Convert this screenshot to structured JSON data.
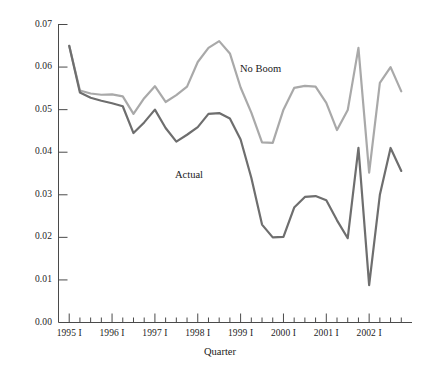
{
  "chart_data": {
    "type": "line",
    "title": "",
    "xlabel": "Quarter",
    "ylabel": "",
    "ylim": [
      0.0,
      0.07
    ],
    "xlim": [
      "1995 I",
      "2002 IV"
    ],
    "grid": false,
    "legend": "inline-annotations",
    "y_ticks": [
      "0.00",
      "0.01",
      "0.02",
      "0.03",
      "0.04",
      "0.05",
      "0.06",
      "0.07"
    ],
    "y_tick_values": [
      0.0,
      0.01,
      0.02,
      0.03,
      0.04,
      0.05,
      0.06,
      0.07
    ],
    "x_ticks": [
      "1995 I",
      "1996 I",
      "1997 I",
      "1998 I",
      "1999 I",
      "2000 I",
      "2001 I",
      "2002 I"
    ],
    "x_tick_values": [
      0,
      4,
      8,
      12,
      16,
      20,
      24,
      28
    ],
    "x": [
      "1995 I",
      "1995 II",
      "1995 III",
      "1995 IV",
      "1996 I",
      "1996 II",
      "1996 III",
      "1996 IV",
      "1997 I",
      "1997 II",
      "1997 III",
      "1997 IV",
      "1998 I",
      "1998 II",
      "1998 III",
      "1998 IV",
      "1999 I",
      "1999 II",
      "1999 III",
      "1999 IV",
      "2000 I",
      "2000 II",
      "2000 III",
      "2000 IV",
      "2001 I",
      "2001 II",
      "2001 III",
      "2001 IV",
      "2002 I",
      "2002 II",
      "2002 III",
      "2002 IV"
    ],
    "series": [
      {
        "name": "No Boom",
        "color": "#a9a9a9",
        "label_position": {
          "x": 240,
          "y": 63
        },
        "values": [
          0.065,
          0.0545,
          0.0538,
          0.0535,
          0.0536,
          0.0531,
          0.049,
          0.0527,
          0.0555,
          0.0518,
          0.0534,
          0.0554,
          0.0612,
          0.0645,
          0.0661,
          0.0632,
          0.0552,
          0.0493,
          0.0423,
          0.0422,
          0.05,
          0.0551,
          0.0556,
          0.0554,
          0.0516,
          0.0452,
          0.0499,
          0.0645,
          0.0352,
          0.0563,
          0.06,
          0.0543
        ]
      },
      {
        "name": "Actual",
        "color": "#6e6e6e",
        "label_position": {
          "x": 175,
          "y": 169
        },
        "values": [
          0.065,
          0.054,
          0.0528,
          0.0521,
          0.0515,
          0.0508,
          0.0445,
          0.047,
          0.05,
          0.0457,
          0.0425,
          0.0441,
          0.0459,
          0.049,
          0.0492,
          0.0479,
          0.043,
          0.034,
          0.023,
          0.02,
          0.0201,
          0.027,
          0.0295,
          0.0297,
          0.0287,
          0.024,
          0.0198,
          0.041,
          0.0088,
          0.03,
          0.041,
          0.0356
        ]
      }
    ]
  },
  "axis": {
    "x_title": "Quarter"
  }
}
